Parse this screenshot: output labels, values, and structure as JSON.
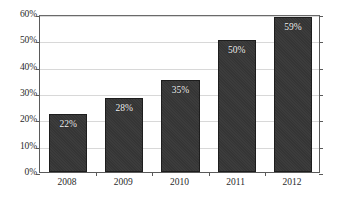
{
  "chart_data": {
    "type": "bar",
    "title": "",
    "subtitle": "",
    "xlabel": "",
    "ylabel": "",
    "categories": [
      "2008",
      "2009",
      "2010",
      "2011",
      "2012"
    ],
    "values": [
      22,
      28,
      35,
      50,
      59
    ],
    "data_labels": [
      "22%",
      "28%",
      "35%",
      "50%",
      "59%"
    ],
    "ylim": [
      0,
      60
    ],
    "ytick_values": [
      0,
      10,
      20,
      30,
      40,
      50,
      60
    ],
    "ytick_labels": [
      "0%",
      "10%",
      "20%",
      "30%",
      "40%",
      "50%",
      "60%"
    ],
    "grid": true,
    "grid_axis": "y",
    "legend": false,
    "legend_position": "none",
    "series": [
      {
        "name": "",
        "values": [
          22,
          28,
          35,
          50,
          59
        ]
      }
    ],
    "colors": {
      "bar_fill": "#353535",
      "bar_edge": "#1d1d1d",
      "gridline": "#d8d8d8",
      "axis": "#5a5a5a",
      "plot_background": "#ffffff",
      "figure_background": "#ffffff",
      "tick_label": "#2b2b2b",
      "data_label": "#f2f2f2"
    }
  }
}
